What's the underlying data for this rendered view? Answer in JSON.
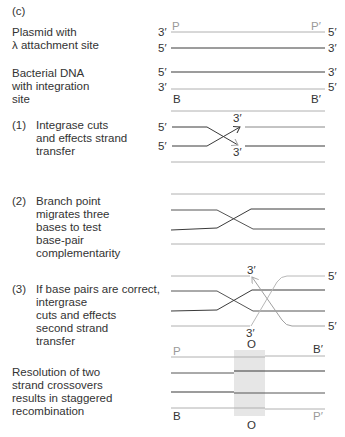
{
  "panel_label": "(c)",
  "colors": {
    "dark_strand": "#3a3a3a",
    "light_strand": "#a8a8a8",
    "shade": "#e4e4e4",
    "text": "#333333",
    "light_text": "#8a8a8a"
  },
  "sections": {
    "plasmid": {
      "label": "Plasmid with\nλ attachment site",
      "top_left_end": "3′",
      "top_right_end": "5′",
      "bottom_left_end": "5′",
      "bottom_right_end": "3′",
      "site_left": "P",
      "site_right": "P′"
    },
    "bacterial": {
      "label": "Bacterial DNA\nwith integration\nsite",
      "top_left_end": "5′",
      "top_right_end": "3′",
      "bottom_left_end": "3′",
      "bottom_right_end": "5′",
      "site_left": "B",
      "site_right": "B′"
    },
    "step1": {
      "number": "(1)",
      "label": "Integrase cuts\nand effects strand\ntransfer",
      "left_top_end": "5′",
      "left_bottom_end": "5′",
      "arrow_top_end": "3′",
      "arrow_bottom_end": "3′"
    },
    "step2": {
      "number": "(2)",
      "label": "Branch point\nmigrates three\nbases to test\nbase-pair\ncomplementarity"
    },
    "step3": {
      "number": "(3)",
      "label": "If base pairs are correct,\nintergrase\ncuts and effects\nsecond strand\ntransfer",
      "arrow_top_end": "3′",
      "arrow_bottom_end": "3′",
      "right_top_end": "5′",
      "right_bottom_end": "5′",
      "core_label": "O"
    },
    "resolution": {
      "label": "Resolution of two\nstrand crossovers\nresults in staggered\nrecombination",
      "top_left": "P",
      "top_right": "B′",
      "bottom_left": "B",
      "bottom_right": "P′",
      "core_label": "O"
    }
  }
}
